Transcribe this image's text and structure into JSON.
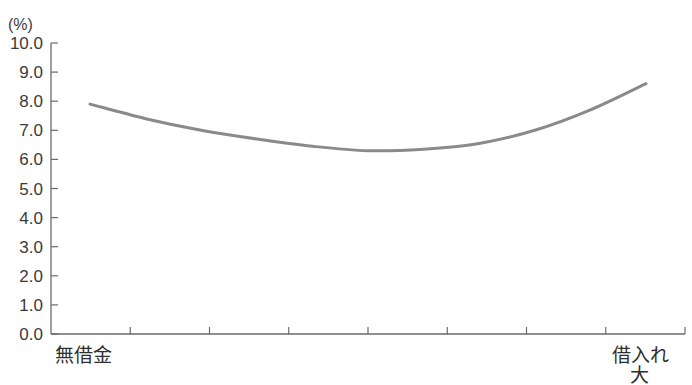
{
  "chart_data": {
    "type": "line",
    "title": "",
    "xlabel": "",
    "ylabel": "(%)",
    "ylim": [
      0,
      10
    ],
    "yticks": [
      "0.0",
      "1.0",
      "2.0",
      "3.0",
      "4.0",
      "5.0",
      "6.0",
      "7.0",
      "8.0",
      "9.0",
      "10.0"
    ],
    "grid": false,
    "legend": null,
    "x_categories": {
      "left": "無借金",
      "right_line1": "借入れ",
      "right_line2": "大"
    },
    "x_tick_count": 8,
    "series": [
      {
        "name": "curve",
        "color": "#8a8a8a",
        "x": [
          0.0,
          0.1,
          0.2,
          0.3,
          0.4,
          0.5,
          0.6,
          0.7,
          0.8,
          0.9,
          1.0
        ],
        "values": [
          7.9,
          7.4,
          7.0,
          6.7,
          6.45,
          6.3,
          6.35,
          6.55,
          7.0,
          7.7,
          8.6
        ]
      }
    ]
  },
  "axis": {
    "unit": "(%)",
    "left_label": "無借金",
    "right_label_1": "借入れ",
    "right_label_2": "大"
  }
}
